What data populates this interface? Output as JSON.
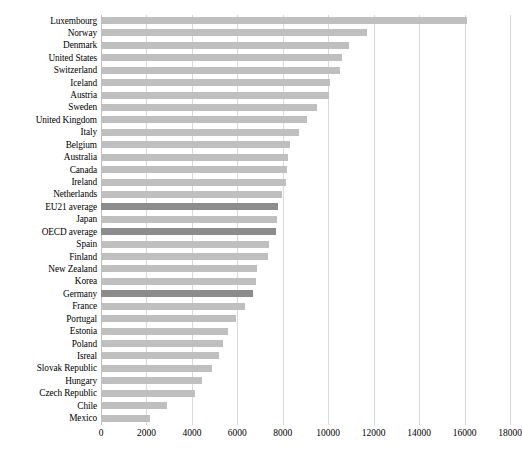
{
  "chart_data": {
    "type": "bar",
    "orientation": "horizontal",
    "title": "",
    "subtitle": "",
    "xlabel": "",
    "ylabel": "",
    "xlim": [
      0,
      18000
    ],
    "xticks": [
      0,
      2000,
      4000,
      6000,
      8000,
      10000,
      12000,
      14000,
      16000,
      18000
    ],
    "xtick_labels": [
      "0",
      "2000",
      "4000",
      "6000",
      "8000",
      "10000",
      "12000",
      "14000",
      "16000",
      "18000"
    ],
    "grid": "vertical",
    "legend": "none",
    "series_name": "Expenditure per student",
    "bar_color": "#bfbfbf",
    "highlight_color": "#8c8c8c",
    "categories": [
      "Luxembourg",
      "Norway",
      "Denmark",
      "United States",
      "Switzerland",
      "Iceland",
      "Austria",
      "Sweden",
      "United Kingdom",
      "Italy",
      "Belgium",
      "Australia",
      "Canada",
      "Ireland",
      "Netherlands",
      "EU21 average",
      "Japan",
      "OECD average",
      "Spain",
      "Finland",
      "New Zealand",
      "Korea",
      "Germany",
      "France",
      "Portugal",
      "Estonia",
      "Poland",
      "Isreal",
      "Slovak Republic",
      "Hungary",
      "Czech Republic",
      "Chile",
      "Mexico"
    ],
    "values": [
      16100,
      11700,
      10900,
      10600,
      10500,
      10100,
      10050,
      9500,
      9050,
      8700,
      8300,
      8250,
      8200,
      8150,
      7950,
      7800,
      7750,
      7700,
      7400,
      7350,
      6850,
      6800,
      6700,
      6350,
      5950,
      5600,
      5350,
      5200,
      4900,
      4450,
      4150,
      2900,
      2150
    ],
    "highlighted": [
      "EU21 average",
      "OECD average",
      "Germany"
    ]
  },
  "caption": {
    "text": ""
  }
}
